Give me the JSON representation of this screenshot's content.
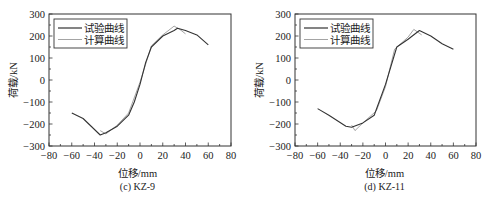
{
  "chart_data": [
    {
      "type": "line",
      "title": "(c) KZ-9",
      "xlabel": "位移/mm",
      "ylabel": "荷载/kN",
      "xlim": [
        -80,
        80
      ],
      "ylim": [
        -300,
        300
      ],
      "xticks": [
        -80,
        -60,
        -40,
        -20,
        0,
        20,
        40,
        60,
        80
      ],
      "yticks": [
        -300,
        -200,
        -100,
        0,
        100,
        200,
        300
      ],
      "grid": false,
      "legend_position": "upper left",
      "series": [
        {
          "name": "试验曲线",
          "color": "#333333",
          "x": [
            -60,
            -50,
            -35,
            -30,
            -20,
            -10,
            -5,
            0,
            5,
            10,
            20,
            30,
            33,
            40,
            50,
            60
          ],
          "y": [
            -150,
            -175,
            -250,
            -240,
            -210,
            -160,
            -100,
            -20,
            80,
            150,
            200,
            225,
            235,
            225,
            205,
            160
          ]
        },
        {
          "name": "计算曲线",
          "color": "#9a9a9a",
          "x": [
            -35,
            -30,
            -20,
            -10,
            0,
            10,
            20,
            30,
            35,
            40
          ],
          "y": [
            -230,
            -245,
            -205,
            -150,
            -10,
            155,
            205,
            245,
            230,
            210
          ]
        }
      ]
    },
    {
      "type": "line",
      "title": "(d) KZ-11",
      "xlabel": "位移/mm",
      "ylabel": "荷载/kN",
      "xlim": [
        -80,
        80
      ],
      "ylim": [
        -300,
        300
      ],
      "xticks": [
        -80,
        -60,
        -40,
        -20,
        0,
        20,
        40,
        60,
        80
      ],
      "yticks": [
        -300,
        -200,
        -100,
        0,
        100,
        200,
        300
      ],
      "grid": false,
      "legend_position": "upper left",
      "series": [
        {
          "name": "试验曲线",
          "color": "#333333",
          "x": [
            -60,
            -50,
            -35,
            -30,
            -20,
            -10,
            0,
            10,
            20,
            30,
            40,
            50,
            60
          ],
          "y": [
            -130,
            -160,
            -210,
            -215,
            -195,
            -160,
            -20,
            150,
            185,
            225,
            200,
            165,
            140
          ]
        },
        {
          "name": "计算曲线",
          "color": "#9a9a9a",
          "x": [
            -30,
            -27,
            -20,
            -8,
            0,
            8,
            20,
            25,
            32
          ],
          "y": [
            -205,
            -230,
            -195,
            -140,
            -30,
            140,
            195,
            230,
            205
          ]
        }
      ]
    }
  ],
  "panels": [
    {
      "caption": "(c)  KZ-9",
      "xlabel": "位移/mm",
      "ylabel": "荷载/kN"
    },
    {
      "caption": "(d)  KZ-11",
      "xlabel": "位移/mm",
      "ylabel": "荷载/kN"
    }
  ]
}
